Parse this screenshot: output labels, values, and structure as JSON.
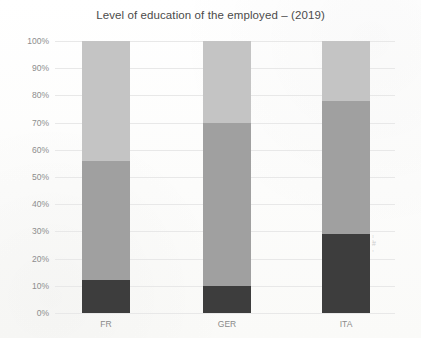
{
  "chart_data": {
    "type": "bar",
    "subtype": "stacked-percent",
    "title": "Level of education of the employed – (2019)",
    "xlabel": "",
    "ylabel": "",
    "categories": [
      "FR",
      "GER",
      "ITA"
    ],
    "ylim": [
      0,
      100
    ],
    "ytick_labels": [
      "0%",
      "10%",
      "20%",
      "30%",
      "40%",
      "50%",
      "60%",
      "70%",
      "80%",
      "90%",
      "100%"
    ],
    "ytick_values": [
      0,
      10,
      20,
      30,
      40,
      50,
      60,
      70,
      80,
      90,
      100
    ],
    "grid": true,
    "legend": "none",
    "units": "percent",
    "series": [
      {
        "name": "low",
        "color": "#3d3d3d",
        "values": [
          12,
          10,
          29
        ]
      },
      {
        "name": "medium",
        "color": "#a0a0a0",
        "values": [
          44,
          60,
          49
        ]
      },
      {
        "name": "high",
        "color": "#c4c4c4",
        "values": [
          44,
          30,
          22
        ]
      }
    ],
    "stack_tops": {
      "FR": [
        12,
        56,
        100
      ],
      "GER": [
        10,
        70,
        100
      ],
      "ITA": [
        29,
        78,
        100
      ]
    }
  },
  "colors": {
    "low": "#3d3d3d",
    "medium": "#a0a0a0",
    "high": "#c4c4c4",
    "gridline": "#e8e8e8",
    "tick_text": "#8d8d8d",
    "title_text": "#4b4b4b",
    "background": "#fdfdfc"
  }
}
